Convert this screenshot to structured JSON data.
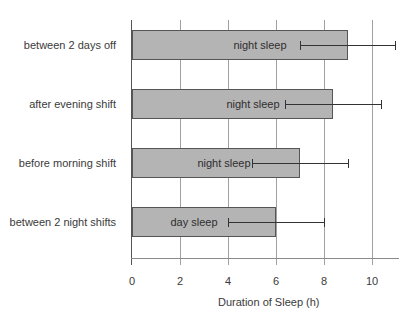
{
  "chart_data": {
    "type": "bar",
    "orientation": "horizontal",
    "title": "",
    "xlabel": "Duration of Sleep (h)",
    "ylabel": "",
    "xlim": [
      0,
      11.2
    ],
    "x_ticks": [
      0,
      2,
      4,
      6,
      8,
      10
    ],
    "grid": true,
    "categories": [
      "between 2 days off",
      "after  evening shift",
      "before morning shift",
      "between 2 night shifts"
    ],
    "bar_labels": [
      "night sleep",
      "night sleep",
      "night sleep",
      "day sleep"
    ],
    "values": [
      9.0,
      8.4,
      7.0,
      6.0
    ],
    "error_bars": [
      {
        "low": 7.0,
        "high": 11.0
      },
      {
        "low": 6.4,
        "high": 10.4
      },
      {
        "low": 5.0,
        "high": 9.0
      },
      {
        "low": 4.0,
        "high": 8.0
      }
    ],
    "legend": null,
    "colors": {
      "bar_fill": "#b4b4b4",
      "bar_border": "#555555",
      "grid": "#a0a0a0",
      "error_bar": "#333333"
    }
  }
}
